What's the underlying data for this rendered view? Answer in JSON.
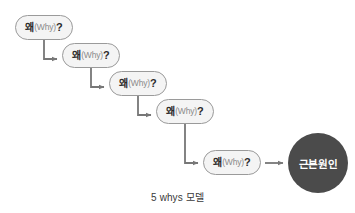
{
  "diagram": {
    "title": "5 whys 모델",
    "caption": "5 whys 모델",
    "colors": {
      "background": "#ffffff",
      "bubble_fill": "#f4f4f4",
      "bubble_border": "#9a9a9a",
      "bubble_text": "#2b2b2b",
      "bubble_subtext": "#8a8a8a",
      "connector": "#777777",
      "root_cause_fill": "#4b4b4b",
      "root_cause_text": "#ffffff",
      "caption_text": "#3a3a3a"
    },
    "steps": [
      {
        "index": 1,
        "ko": "왜",
        "en": "(Why)",
        "mark": "?",
        "full": "왜(Why)?"
      },
      {
        "index": 2,
        "ko": "왜",
        "en": "(Why)",
        "mark": "?",
        "full": "왜(Why)?"
      },
      {
        "index": 3,
        "ko": "왜",
        "en": "(Why)",
        "mark": "?",
        "full": "왜(Why)?"
      },
      {
        "index": 4,
        "ko": "왜",
        "en": "(Why)",
        "mark": "?",
        "full": "왜(Why)?"
      },
      {
        "index": 5,
        "ko": "왜",
        "en": "(Why)",
        "mark": "?",
        "full": "왜(Why)?"
      }
    ],
    "root_cause": {
      "label": "근본원인"
    },
    "connectors": [
      {
        "from": 1,
        "to": 2,
        "shape": "elbow-down-right"
      },
      {
        "from": 2,
        "to": 3,
        "shape": "elbow-down-right"
      },
      {
        "from": 3,
        "to": 4,
        "shape": "elbow-down-right"
      },
      {
        "from": 4,
        "to": 5,
        "shape": "elbow-down-right"
      },
      {
        "from": 5,
        "to": "root_cause",
        "shape": "straight-right"
      }
    ]
  }
}
